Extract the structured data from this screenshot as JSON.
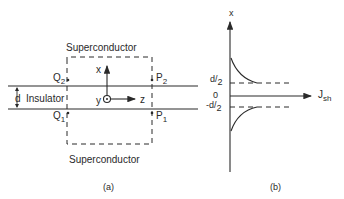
{
  "panel_a": {
    "caption": "(a)",
    "top_region_label": "Superconductor",
    "bottom_region_label": "Superconductor",
    "middle_region_label": "Insulator",
    "thickness_label": "d",
    "points": {
      "q2": {
        "letter": "Q",
        "sub": "2"
      },
      "p2": {
        "letter": "P",
        "sub": "2"
      },
      "q1": {
        "letter": "Q",
        "sub": "1"
      },
      "p1": {
        "letter": "P",
        "sub": "1"
      }
    },
    "axes": {
      "x": "x",
      "y": "y",
      "z": "z"
    }
  },
  "panel_b": {
    "caption": "(b)",
    "vertical_axis_label": "x",
    "horizontal_axis_label": {
      "main": "J",
      "sub": "sh"
    },
    "ticks": {
      "top": {
        "num": "d",
        "den": "2"
      },
      "zero": "0",
      "bottom": {
        "num": "-d",
        "den": "2"
      }
    }
  },
  "colors": {
    "ink": "#2a2a2a",
    "background": "#ffffff"
  }
}
